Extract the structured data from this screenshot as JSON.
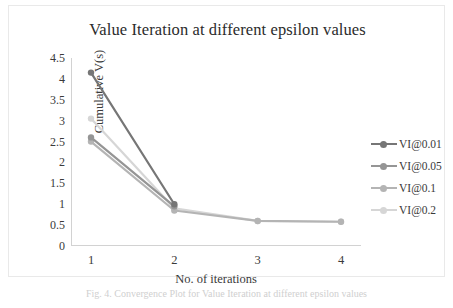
{
  "chart_data": {
    "type": "line",
    "title": "Value Iteration at different epsilon values",
    "xlabel": "No. of iterations",
    "ylabel": "Cumulative V(s)",
    "x": [
      1,
      2,
      3,
      4
    ],
    "xticklabels": [
      "1",
      "2",
      "3",
      "4"
    ],
    "yticklabels": [
      "0",
      "0.5",
      "1",
      "1.5",
      "2",
      "2.5",
      "3",
      "3.5",
      "4",
      "4.5"
    ],
    "ylim": [
      0,
      4.5
    ],
    "ytick_step": 0.5,
    "grid": false,
    "legend_position": "right",
    "series": [
      {
        "name": "VI@0.01",
        "color": "#767676",
        "x": [
          1,
          2
        ],
        "values": [
          4.15,
          1.0
        ]
      },
      {
        "name": "VI@0.05",
        "color": "#959595",
        "x": [
          1,
          2
        ],
        "values": [
          2.6,
          0.95
        ]
      },
      {
        "name": "VI@0.1",
        "color": "#b4b4b4",
        "x": [
          1,
          2,
          3,
          4
        ],
        "values": [
          2.5,
          0.85,
          0.6,
          0.58
        ]
      },
      {
        "name": "VI@0.2",
        "color": "#d6d6d6",
        "x": [
          1,
          2,
          3,
          4
        ],
        "values": [
          3.05,
          0.9,
          0.6,
          0.58
        ]
      }
    ]
  },
  "legend": {
    "items": [
      {
        "label": "VI@0.01",
        "color": "#767676"
      },
      {
        "label": "VI@0.05",
        "color": "#959595"
      },
      {
        "label": "VI@0.1",
        "color": "#b4b4b4"
      },
      {
        "label": "VI@0.2",
        "color": "#d6d6d6"
      }
    ]
  },
  "caption": {
    "text": "Fig. 4.  Convergence Plot for Value Iteration at different epsilon values"
  }
}
